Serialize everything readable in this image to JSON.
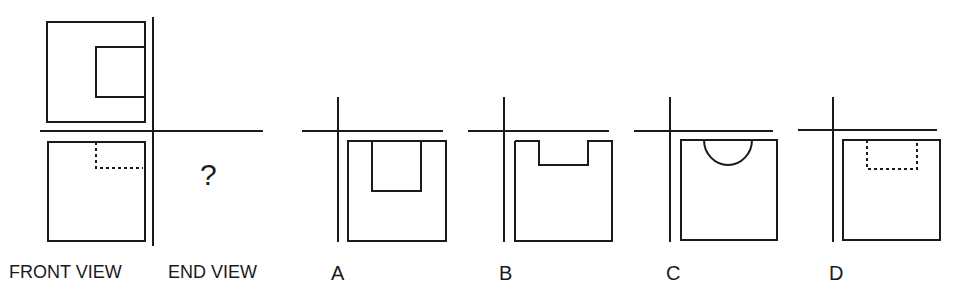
{
  "problem": {
    "question_mark": "?",
    "labels": {
      "front_view": "FRONT VIEW",
      "end_view": "END VIEW"
    }
  },
  "options": [
    {
      "label": "A",
      "shape": "square-with-rectangular-notch-solid-deep"
    },
    {
      "label": "B",
      "shape": "square-with-rectangular-notch-solid-shallow"
    },
    {
      "label": "C",
      "shape": "square-with-semicircle-notch"
    },
    {
      "label": "D",
      "shape": "square-with-hidden-dashed-rectangle"
    }
  ],
  "colors": {
    "line": "#1a1a1a",
    "background": "#ffffff"
  }
}
